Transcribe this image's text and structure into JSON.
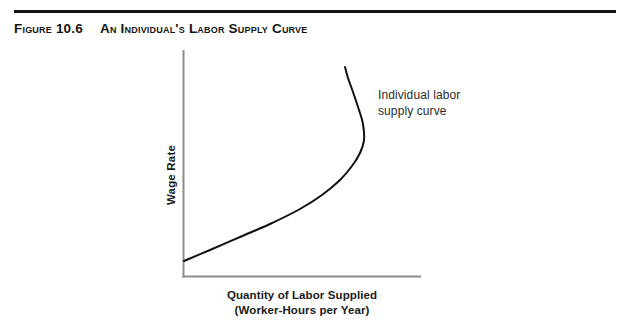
{
  "page": {
    "width": 632,
    "height": 333,
    "background": "#ffffff"
  },
  "header": {
    "rule_color": "#141414",
    "figure_number": "Figure 10.6",
    "figure_title": "An Individual's Labor Supply Curve"
  },
  "axes": {
    "y_title": "Wage Rate",
    "x_title_line1": "Quantity of Labor Supplied",
    "x_title_line2": "(Worker-Hours per Year)",
    "axis_color": "#8c8c8c"
  },
  "annotation": {
    "line1": "Individual labor",
    "line2": "supply curve"
  },
  "chart_data": {
    "type": "line",
    "title": "An Individual's Labor Supply Curve",
    "xlabel": "Quantity of Labor Supplied (Worker-Hours per Year)",
    "ylabel": "Wage Rate",
    "grid": false,
    "legend": "none",
    "axis_ticks": [],
    "xlim": [
      0,
      100
    ],
    "ylim": [
      0,
      100
    ],
    "series": [
      {
        "name": "Individual labor supply curve",
        "color": "#111111",
        "line_width": 2,
        "description": "Backward-bending labor supply curve: upward sloping at low wage rates, bending back toward the vertical axis at high wage rates.",
        "points_px": [
          [
            184,
            261
          ],
          [
            210,
            250
          ],
          [
            240,
            237
          ],
          [
            270,
            224
          ],
          [
            300,
            209
          ],
          [
            322,
            195
          ],
          [
            340,
            180
          ],
          [
            352,
            166
          ],
          [
            360,
            153
          ],
          [
            364,
            140
          ],
          [
            363,
            124
          ],
          [
            359,
            110
          ],
          [
            353,
            92
          ],
          [
            348,
            78
          ],
          [
            345,
            67
          ]
        ]
      }
    ]
  }
}
